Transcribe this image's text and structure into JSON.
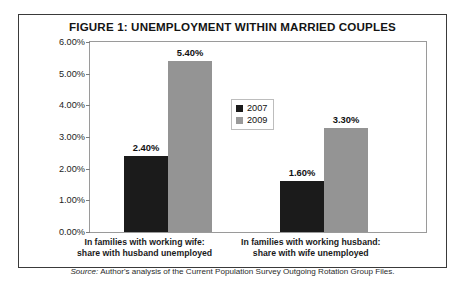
{
  "figure": {
    "title": "FIGURE 1: UNEMPLOYMENT WITHIN MARRIED COUPLES",
    "source_prefix": "Source:",
    "source_text": " Author's analysis of the Current Population Survey Outgoing Rotation Group Files."
  },
  "colors": {
    "series_2007": "#1b1b1b",
    "series_2009": "#949494",
    "panel_border": "#3a3a3a",
    "plot_border": "#9a9a9a"
  },
  "chart_data": {
    "type": "bar",
    "title": "FIGURE 1: UNEMPLOYMENT WITHIN MARRIED COUPLES",
    "xlabel": "",
    "ylabel": "",
    "ylim": [
      0,
      6
    ],
    "yticks": [
      0,
      1,
      2,
      3,
      4,
      5,
      6
    ],
    "ytick_labels": [
      "0.00%",
      "1.00%",
      "2.00%",
      "3.00%",
      "4.00%",
      "5.00%",
      "6.00%"
    ],
    "grid": false,
    "legend_position": "center",
    "categories": [
      "In families with working wife:\nshare with husband unemployed",
      "In families with working husband:\nshare with wife unemployed"
    ],
    "category_lines": [
      [
        "In families with working wife:",
        "share with husband unemployed"
      ],
      [
        "In families with working husband:",
        "share with wife unemployed"
      ]
    ],
    "series": [
      {
        "name": "2007",
        "color": "#1b1b1b",
        "values": [
          2.4,
          1.6
        ],
        "labels": [
          "2.40%",
          "1.60%"
        ]
      },
      {
        "name": "2009",
        "color": "#949494",
        "values": [
          5.4,
          3.3
        ],
        "labels": [
          "5.40%",
          "3.30%"
        ]
      }
    ]
  }
}
